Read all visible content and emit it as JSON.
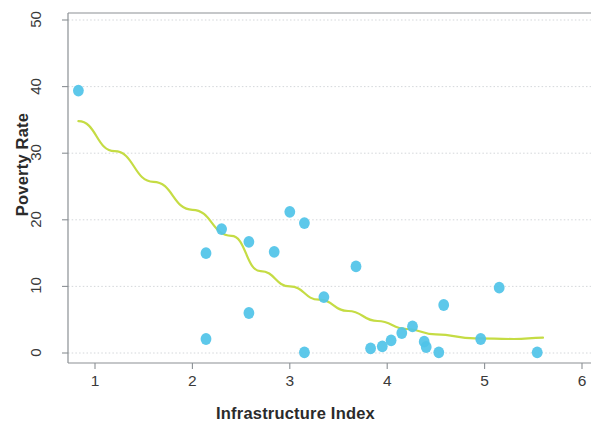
{
  "chart_data": {
    "type": "scatter",
    "title": "",
    "xlabel": "Infrastructure Index",
    "ylabel": "Poverty Rate",
    "xlim": [
      0.62,
      6.1
    ],
    "ylim": [
      -1.5,
      51.5
    ],
    "xticks": [
      1,
      2,
      3,
      4,
      5,
      6
    ],
    "xtick_labels": [
      "1",
      "2",
      "3",
      "4",
      "5",
      "6"
    ],
    "yticks": [
      0,
      10,
      20,
      30,
      40,
      50
    ],
    "ytick_labels": [
      "0",
      "10",
      "20",
      "30",
      "40",
      "50"
    ],
    "grid": true,
    "grid_axis": "y",
    "legend": "none",
    "marker_color": "#4FC3E8",
    "trend_color": "#C5DC44",
    "grid_color": "#cfd3d6",
    "axis_color": "#8b9094",
    "points": [
      {
        "x": 0.83,
        "y": 39.4
      },
      {
        "x": 2.14,
        "y": 15.0
      },
      {
        "x": 2.14,
        "y": 2.1
      },
      {
        "x": 2.3,
        "y": 18.6
      },
      {
        "x": 2.58,
        "y": 16.7
      },
      {
        "x": 2.58,
        "y": 6.0
      },
      {
        "x": 2.84,
        "y": 15.2
      },
      {
        "x": 3.0,
        "y": 21.2
      },
      {
        "x": 3.15,
        "y": 19.5
      },
      {
        "x": 3.15,
        "y": 0.1
      },
      {
        "x": 3.35,
        "y": 8.4
      },
      {
        "x": 3.68,
        "y": 13.0
      },
      {
        "x": 3.83,
        "y": 0.7
      },
      {
        "x": 3.95,
        "y": 1.0
      },
      {
        "x": 4.04,
        "y": 1.9
      },
      {
        "x": 4.15,
        "y": 3.0
      },
      {
        "x": 4.26,
        "y": 4.0
      },
      {
        "x": 4.38,
        "y": 1.7
      },
      {
        "x": 4.4,
        "y": 0.9
      },
      {
        "x": 4.53,
        "y": 0.1
      },
      {
        "x": 4.58,
        "y": 7.2
      },
      {
        "x": 4.96,
        "y": 2.1
      },
      {
        "x": 5.15,
        "y": 9.8
      },
      {
        "x": 5.54,
        "y": 0.1
      }
    ],
    "trend_curve": {
      "note": "fitted decreasing convex curve",
      "points": [
        {
          "x": 0.83,
          "y": 34.8
        },
        {
          "x": 1.2,
          "y": 30.3
        },
        {
          "x": 1.6,
          "y": 25.7
        },
        {
          "x": 2.0,
          "y": 21.5
        },
        {
          "x": 2.4,
          "y": 17.6
        },
        {
          "x": 2.7,
          "y": 12.3
        },
        {
          "x": 3.0,
          "y": 10.0
        },
        {
          "x": 3.3,
          "y": 8.0
        },
        {
          "x": 3.6,
          "y": 6.3
        },
        {
          "x": 3.9,
          "y": 4.8
        },
        {
          "x": 4.2,
          "y": 3.6
        },
        {
          "x": 4.5,
          "y": 2.8
        },
        {
          "x": 4.9,
          "y": 2.2
        },
        {
          "x": 5.3,
          "y": 2.1
        },
        {
          "x": 5.6,
          "y": 2.3
        }
      ]
    }
  }
}
